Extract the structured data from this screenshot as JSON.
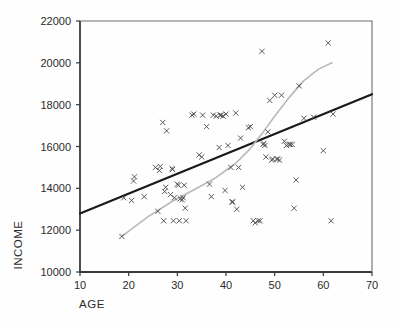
{
  "chart_data": {
    "type": "scatter",
    "title": "",
    "xlabel": "AGE",
    "ylabel": "INCOME",
    "xlim": [
      10,
      70
    ],
    "ylim": [
      10000,
      22000
    ],
    "xticks": [
      10,
      20,
      30,
      40,
      50,
      60,
      70
    ],
    "yticks": [
      10000,
      12000,
      14000,
      16000,
      18000,
      20000,
      22000
    ],
    "xtick_labels": [
      "10",
      "20",
      "30",
      "40",
      "50",
      "60",
      "70"
    ],
    "ytick_labels": [
      "10000",
      "12000",
      "14000",
      "16000",
      "18000",
      "20000",
      "22000"
    ],
    "grid": false,
    "legend": null,
    "marker": "x",
    "marker_color": "#4a4a4a",
    "points": [
      [
        18.6,
        11700
      ],
      [
        19.0,
        13550
      ],
      [
        20.6,
        13420
      ],
      [
        21.0,
        14350
      ],
      [
        21.2,
        14550
      ],
      [
        23.2,
        13600
      ],
      [
        25.5,
        15000
      ],
      [
        26.0,
        12900
      ],
      [
        26.3,
        14850
      ],
      [
        26.5,
        15050
      ],
      [
        27.0,
        17150
      ],
      [
        27.2,
        12450
      ],
      [
        27.4,
        13850
      ],
      [
        27.6,
        14050
      ],
      [
        27.8,
        16750
      ],
      [
        28.6,
        13700
      ],
      [
        28.9,
        14950
      ],
      [
        29.0,
        14900
      ],
      [
        29.2,
        12450
      ],
      [
        29.4,
        13550
      ],
      [
        30.0,
        14200
      ],
      [
        30.2,
        14150
      ],
      [
        30.4,
        12450
      ],
      [
        30.6,
        13500
      ],
      [
        31.0,
        13450
      ],
      [
        31.2,
        13550
      ],
      [
        31.4,
        14150
      ],
      [
        31.6,
        13050
      ],
      [
        31.8,
        12450
      ],
      [
        33.0,
        17500
      ],
      [
        33.4,
        17550
      ],
      [
        34.5,
        15600
      ],
      [
        35.0,
        15500
      ],
      [
        35.2,
        17500
      ],
      [
        36.0,
        16950
      ],
      [
        36.6,
        14200
      ],
      [
        37.0,
        13600
      ],
      [
        37.4,
        17500
      ],
      [
        38.0,
        17450
      ],
      [
        38.6,
        15950
      ],
      [
        38.8,
        17500
      ],
      [
        39.0,
        17500
      ],
      [
        39.4,
        17450
      ],
      [
        39.8,
        13900
      ],
      [
        40.0,
        17550
      ],
      [
        40.4,
        16050
      ],
      [
        41.0,
        15000
      ],
      [
        41.2,
        13350
      ],
      [
        41.4,
        13350
      ],
      [
        42.0,
        17600
      ],
      [
        42.2,
        13000
      ],
      [
        42.6,
        15000
      ],
      [
        43.0,
        16400
      ],
      [
        43.4,
        14050
      ],
      [
        44.6,
        16900
      ],
      [
        45.0,
        16950
      ],
      [
        45.6,
        12450
      ],
      [
        46.0,
        12350
      ],
      [
        46.6,
        12450
      ],
      [
        47.0,
        12450
      ],
      [
        47.4,
        20550
      ],
      [
        47.6,
        16100
      ],
      [
        47.8,
        16150
      ],
      [
        48.0,
        16050
      ],
      [
        48.2,
        15500
      ],
      [
        48.6,
        16700
      ],
      [
        49.0,
        18200
      ],
      [
        49.4,
        15350
      ],
      [
        49.6,
        15400
      ],
      [
        50.0,
        18450
      ],
      [
        50.4,
        15400
      ],
      [
        50.6,
        15400
      ],
      [
        51.0,
        15350
      ],
      [
        51.4,
        18450
      ],
      [
        52.0,
        16250
      ],
      [
        52.4,
        16050
      ],
      [
        53.0,
        16100
      ],
      [
        53.2,
        16100
      ],
      [
        53.6,
        16100
      ],
      [
        54.0,
        13050
      ],
      [
        54.4,
        14400
      ],
      [
        55.0,
        18900
      ],
      [
        56.0,
        17350
      ],
      [
        58.0,
        17400
      ],
      [
        60.0,
        15800
      ],
      [
        61.0,
        20950
      ],
      [
        61.6,
        12450
      ],
      [
        62.0,
        17550
      ]
    ],
    "series_lines": [
      {
        "name": "linear-fit",
        "style": "solid",
        "color": "#1a1a1a",
        "width": 2.2,
        "points": [
          [
            10,
            12800
          ],
          [
            70,
            18500
          ]
        ]
      },
      {
        "name": "smoothed-fit",
        "style": "solid",
        "color": "#b9b9b9",
        "width": 1.6,
        "points": [
          [
            18.6,
            11700
          ],
          [
            24.0,
            12650
          ],
          [
            29.0,
            13380
          ],
          [
            34.0,
            14000
          ],
          [
            38.0,
            14520
          ],
          [
            42.0,
            15200
          ],
          [
            45.0,
            15900
          ],
          [
            47.5,
            16650
          ],
          [
            50.0,
            17450
          ],
          [
            53.0,
            18350
          ],
          [
            56.0,
            19150
          ],
          [
            59.0,
            19700
          ],
          [
            61.8,
            20000
          ]
        ]
      }
    ]
  }
}
